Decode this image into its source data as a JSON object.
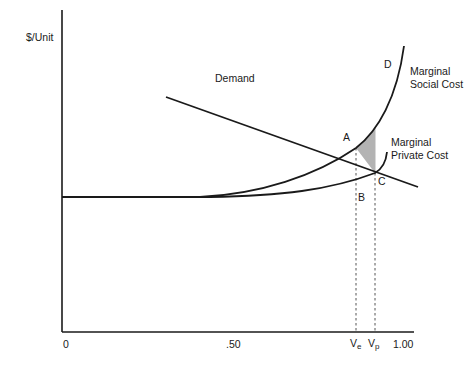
{
  "chart_data": {
    "type": "line",
    "title": "",
    "xlabel": "",
    "ylabel": "$/Unit",
    "x_ticks": [
      "0",
      ".50",
      "Ve",
      "Vp",
      "1.00"
    ],
    "xlim": [
      0,
      1.0
    ],
    "grid": false,
    "legend": "inline labels",
    "series": [
      {
        "name": "Demand",
        "shape": "downward sloping straight line",
        "x": [
          0.3,
          1.02
        ],
        "y": [
          0.73,
          0.45
        ]
      },
      {
        "name": "Marginal Social Cost",
        "shape": "flat then convex rising",
        "x": [
          0.0,
          0.4,
          0.6,
          0.76,
          0.85,
          0.9,
          0.93
        ],
        "y": [
          0.42,
          0.42,
          0.46,
          0.54,
          0.57,
          0.71,
          0.89
        ]
      },
      {
        "name": "Marginal Private Cost",
        "shape": "flat then gently rising with hook",
        "x": [
          0.0,
          0.4,
          0.7,
          0.9,
          0.97
        ],
        "y": [
          0.42,
          0.42,
          0.44,
          0.49,
          0.56
        ]
      }
    ],
    "points": [
      {
        "label": "A",
        "desc": "Demand ∩ Marginal Social Cost at Ve"
      },
      {
        "label": "B",
        "desc": "Marginal Private Cost at Ve"
      },
      {
        "label": "C",
        "desc": "Demand ∩ Marginal Private Cost at Vp"
      },
      {
        "label": "D",
        "desc": "Marginal Social Cost at Vp"
      }
    ],
    "shaded_region": "A-D-C (deadweight loss)",
    "vertical_guides": [
      "Ve",
      "Vp"
    ]
  },
  "labels": {
    "ylabel": "$/Unit",
    "demand": "Demand",
    "msc_line1": "Marginal",
    "msc_line2": "Social Cost",
    "mpc_line1": "Marginal",
    "mpc_line2": "Private Cost",
    "point_a": "A",
    "point_b": "B",
    "point_c": "C",
    "point_d": "D",
    "tick_0": "0",
    "tick_50": ".50",
    "tick_ve_main": "V",
    "tick_ve_sub": "e",
    "tick_vp_main": "V",
    "tick_vp_sub": "p",
    "tick_100": "1.00"
  },
  "colors": {
    "line": "#1a1a1a",
    "shade": "#b3b3b3",
    "guide": "#555555"
  }
}
